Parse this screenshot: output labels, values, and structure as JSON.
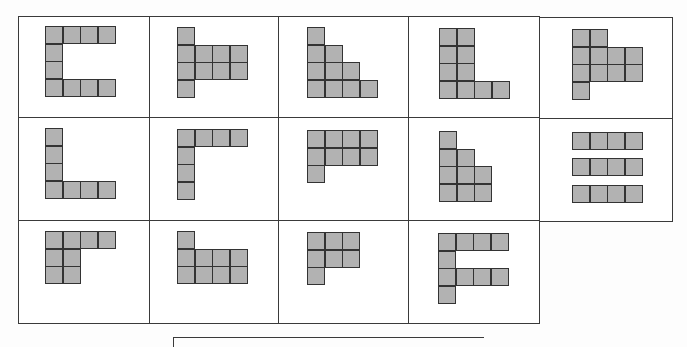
{
  "figure": {
    "cell_size": 18,
    "colors": {
      "cell_fill": "#b2b2b2",
      "cell_border": "#333333",
      "panel_border": "#3a3a3a"
    },
    "panels": [
      {
        "id": "r1c1",
        "x": 18,
        "y": 16,
        "w": 132,
        "h": 102,
        "ox": 45,
        "oy": 26,
        "cells": [
          [
            0,
            0
          ],
          [
            1,
            0
          ],
          [
            2,
            0
          ],
          [
            3,
            0
          ],
          [
            0,
            1
          ],
          [
            0,
            2
          ],
          [
            0,
            3
          ],
          [
            1,
            3
          ],
          [
            2,
            3
          ],
          [
            3,
            3
          ]
        ]
      },
      {
        "id": "r1c2",
        "x": 149,
        "y": 16,
        "w": 130,
        "h": 102,
        "ox": 177,
        "oy": 27,
        "cells": [
          [
            0,
            0
          ],
          [
            0,
            1
          ],
          [
            1,
            1
          ],
          [
            2,
            1
          ],
          [
            3,
            1
          ],
          [
            0,
            2
          ],
          [
            1,
            2
          ],
          [
            2,
            2
          ],
          [
            3,
            2
          ],
          [
            0,
            3
          ]
        ]
      },
      {
        "id": "r1c3",
        "x": 278,
        "y": 16,
        "w": 131,
        "h": 102,
        "ox": 307,
        "oy": 27,
        "cells": [
          [
            0,
            0
          ],
          [
            0,
            1
          ],
          [
            1,
            1
          ],
          [
            0,
            2
          ],
          [
            1,
            2
          ],
          [
            2,
            2
          ],
          [
            0,
            3
          ],
          [
            1,
            3
          ],
          [
            2,
            3
          ],
          [
            3,
            3
          ]
        ]
      },
      {
        "id": "r1c4",
        "x": 408,
        "y": 16,
        "w": 132,
        "h": 102,
        "ox": 439,
        "oy": 28,
        "cells": [
          [
            0,
            0
          ],
          [
            1,
            0
          ],
          [
            0,
            1
          ],
          [
            1,
            1
          ],
          [
            0,
            2
          ],
          [
            1,
            2
          ],
          [
            0,
            3
          ],
          [
            1,
            3
          ],
          [
            2,
            3
          ],
          [
            3,
            3
          ]
        ]
      },
      {
        "id": "r1c5",
        "x": 539,
        "y": 17,
        "w": 134,
        "h": 102,
        "ox": 572,
        "oy": 29,
        "cells": [
          [
            0,
            0
          ],
          [
            1,
            0
          ],
          [
            0,
            1
          ],
          [
            1,
            1
          ],
          [
            2,
            1
          ],
          [
            3,
            1
          ],
          [
            0,
            2
          ],
          [
            1,
            2
          ],
          [
            2,
            2
          ],
          [
            3,
            2
          ],
          [
            0,
            3
          ]
        ]
      },
      {
        "id": "r2c1",
        "x": 18,
        "y": 117,
        "w": 132,
        "h": 104,
        "ox": 45,
        "oy": 128,
        "cells": [
          [
            0,
            0
          ],
          [
            0,
            1
          ],
          [
            0,
            2
          ],
          [
            0,
            3
          ],
          [
            1,
            3
          ],
          [
            2,
            3
          ],
          [
            3,
            3
          ]
        ]
      },
      {
        "id": "r2c2",
        "x": 149,
        "y": 117,
        "w": 130,
        "h": 104,
        "ox": 177,
        "oy": 129,
        "cells": [
          [
            0,
            0
          ],
          [
            1,
            0
          ],
          [
            2,
            0
          ],
          [
            3,
            0
          ],
          [
            0,
            1
          ],
          [
            0,
            2
          ],
          [
            0,
            3
          ]
        ]
      },
      {
        "id": "r2c3",
        "x": 278,
        "y": 117,
        "w": 131,
        "h": 104,
        "ox": 307,
        "oy": 130,
        "cells": [
          [
            0,
            0
          ],
          [
            1,
            0
          ],
          [
            2,
            0
          ],
          [
            3,
            0
          ],
          [
            0,
            1
          ],
          [
            1,
            1
          ],
          [
            2,
            1
          ],
          [
            3,
            1
          ],
          [
            0,
            2
          ]
        ]
      },
      {
        "id": "r2c4",
        "x": 408,
        "y": 117,
        "w": 132,
        "h": 104,
        "ox": 439,
        "oy": 131,
        "cells": [
          [
            0,
            0
          ],
          [
            0,
            1
          ],
          [
            1,
            1
          ],
          [
            0,
            2
          ],
          [
            1,
            2
          ],
          [
            2,
            2
          ],
          [
            0,
            3
          ],
          [
            1,
            3
          ],
          [
            2,
            3
          ]
        ]
      },
      {
        "id": "r2c5",
        "x": 539,
        "y": 118,
        "w": 134,
        "h": 104,
        "ox": 572,
        "oy": 132,
        "cells": [
          [
            0,
            0
          ],
          [
            1,
            0
          ],
          [
            2,
            0
          ],
          [
            3,
            0
          ],
          [
            0,
            1.5
          ],
          [
            1,
            1.5
          ],
          [
            2,
            1.5
          ],
          [
            3,
            1.5
          ],
          [
            0,
            3
          ],
          [
            1,
            3
          ],
          [
            2,
            3
          ],
          [
            3,
            3
          ]
        ]
      },
      {
        "id": "r3c1",
        "x": 18,
        "y": 220,
        "w": 132,
        "h": 104,
        "ox": 45,
        "oy": 231,
        "cells": [
          [
            0,
            0
          ],
          [
            1,
            0
          ],
          [
            2,
            0
          ],
          [
            3,
            0
          ],
          [
            0,
            1
          ],
          [
            1,
            1
          ],
          [
            0,
            2
          ],
          [
            1,
            2
          ]
        ]
      },
      {
        "id": "r3c2",
        "x": 149,
        "y": 220,
        "w": 130,
        "h": 104,
        "ox": 177,
        "oy": 231,
        "cells": [
          [
            0,
            0
          ],
          [
            0,
            1
          ],
          [
            1,
            1
          ],
          [
            2,
            1
          ],
          [
            3,
            1
          ],
          [
            0,
            2
          ],
          [
            1,
            2
          ],
          [
            2,
            2
          ],
          [
            3,
            2
          ]
        ]
      },
      {
        "id": "r3c3",
        "x": 278,
        "y": 220,
        "w": 131,
        "h": 104,
        "ox": 307,
        "oy": 232,
        "cells": [
          [
            0,
            0
          ],
          [
            1,
            0
          ],
          [
            2,
            0
          ],
          [
            0,
            1
          ],
          [
            1,
            1
          ],
          [
            2,
            1
          ],
          [
            0,
            2
          ]
        ]
      },
      {
        "id": "r3c4",
        "x": 408,
        "y": 220,
        "w": 132,
        "h": 104,
        "ox": 438,
        "oy": 233,
        "cells": [
          [
            0,
            0
          ],
          [
            1,
            0
          ],
          [
            2,
            0
          ],
          [
            3,
            0
          ],
          [
            0,
            1
          ],
          [
            0,
            2
          ],
          [
            1,
            2
          ],
          [
            2,
            2
          ],
          [
            3,
            2
          ],
          [
            0,
            3
          ]
        ]
      }
    ]
  }
}
